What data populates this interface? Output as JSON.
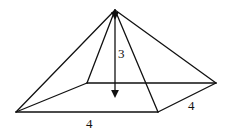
{
  "diagram": {
    "type": "square-pyramid",
    "stroke_color": "#111111",
    "vertices": {
      "apex": [
        115,
        10
      ],
      "front_left": [
        16,
        112
      ],
      "front_right": [
        158,
        112
      ],
      "back_right": [
        216,
        83
      ],
      "back_left": [
        87,
        83
      ],
      "base_center": [
        115,
        98
      ]
    },
    "labels": {
      "height": "3",
      "front_edge": "4",
      "side_edge": "4"
    }
  }
}
